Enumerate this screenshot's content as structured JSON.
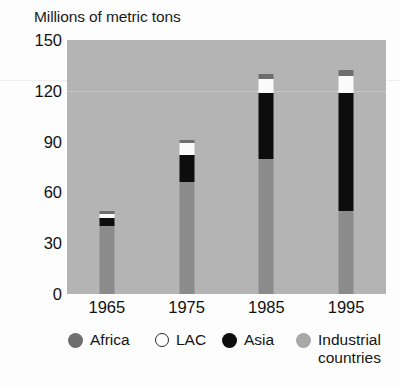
{
  "chart_data": {
    "type": "bar",
    "subtype": "stacked",
    "title": "Millions of metric tons",
    "xlabel": "",
    "ylabel": "Millions of metric tons",
    "categories": [
      "1965",
      "1975",
      "1985",
      "1995"
    ],
    "yticks": [
      0,
      30,
      60,
      90,
      120,
      150
    ],
    "ylim": [
      0,
      150
    ],
    "grid": true,
    "gridlines_at": [
      120
    ],
    "legend_position": "bottom",
    "series": [
      {
        "name": "Industrial countries",
        "color": "#8c8c8c",
        "values": [
          40,
          66,
          80,
          49
        ]
      },
      {
        "name": "Asia",
        "color": "#0d0d0d",
        "values": [
          5,
          16,
          39,
          70
        ]
      },
      {
        "name": "LAC",
        "color": "#fafafa",
        "values": [
          2,
          7,
          8,
          10
        ]
      },
      {
        "name": "Africa",
        "color": "#6e6e6e",
        "values": [
          2,
          2,
          3,
          3
        ]
      }
    ],
    "totals": [
      49,
      91,
      130,
      132
    ],
    "plot_background": "#b4b4b4"
  },
  "axis": {
    "y_ticks": [
      {
        "label": "150",
        "value": 150
      },
      {
        "label": "120",
        "value": 120
      },
      {
        "label": "90",
        "value": 90
      },
      {
        "label": "60",
        "value": 60
      },
      {
        "label": "30",
        "value": 30
      },
      {
        "label": "0",
        "value": 0
      }
    ],
    "x_ticks": [
      {
        "label": "1965"
      },
      {
        "label": "1975"
      },
      {
        "label": "1985"
      },
      {
        "label": "1995"
      }
    ]
  },
  "legend": {
    "items": [
      {
        "label": "Africa",
        "color": "#6e6e6e",
        "outline": "none"
      },
      {
        "label": "LAC",
        "color": "#fcfcfc",
        "outline": "#2a2a2a"
      },
      {
        "label": "Asia",
        "color": "#0d0d0d",
        "outline": "none"
      },
      {
        "label": "Industrial\ncountries",
        "color": "#a8a8a8",
        "outline": "none"
      }
    ]
  }
}
